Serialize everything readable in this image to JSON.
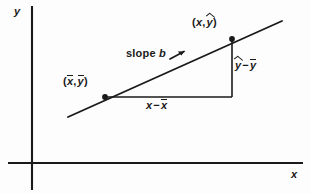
{
  "figure": {
    "background_color": "#fdfdfd",
    "ink_color": "#1a1a1a"
  },
  "axes": {
    "y_label": "y",
    "x_label": "x",
    "origin": {
      "x": 32,
      "y": 163
    },
    "y_axis": {
      "x": 32,
      "top": 6,
      "bottom": 190
    },
    "x_axis": {
      "y": 163,
      "left": 8,
      "right": 303
    }
  },
  "labels": {
    "point_fitted": {
      "text": "(x, ŷ)",
      "open_paren": "(",
      "x_symbol": "x",
      "comma": ",",
      "y_symbol": "y",
      "y_accent": "hat",
      "close_paren": ")"
    },
    "point_means": {
      "text": "(x̄, ȳ)",
      "open_paren": "(",
      "x_symbol": "x",
      "x_accent": "bar",
      "comma": ",",
      "y_symbol": "y",
      "y_accent": "bar",
      "close_paren": ")"
    },
    "slope": {
      "word": "slope",
      "symbol": "b",
      "arrow": "arrow-up-right"
    },
    "rise": {
      "text": "ŷ − ȳ",
      "first_symbol": "y",
      "first_accent": "hat",
      "operator": "−",
      "second_symbol": "y",
      "second_accent": "bar"
    },
    "run": {
      "text": "x − x̄",
      "first_symbol": "x",
      "first_accent": "none",
      "operator": "−",
      "second_symbol": "x",
      "second_accent": "bar"
    }
  },
  "geometry": {
    "regression_line": {
      "x1": 68,
      "y1": 117,
      "x2": 282,
      "y2": 21
    },
    "point_means_dot": {
      "cx": 105,
      "cy": 97,
      "r": 2.8
    },
    "point_fitted_dot": {
      "cx": 232,
      "cy": 39,
      "r": 2.8
    },
    "run_leg": {
      "x1": 105,
      "y1": 97,
      "x2": 232,
      "y2": 97
    },
    "rise_leg": {
      "x1": 232,
      "y1": 39,
      "x2": 232,
      "y2": 97
    },
    "slope_arrow": {
      "x1": 172,
      "y1": 58,
      "x2": 184,
      "y2": 52
    }
  }
}
